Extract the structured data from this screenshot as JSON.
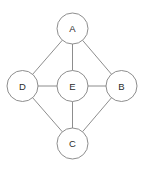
{
  "diagram": {
    "type": "undirected-graph",
    "title": "",
    "width": 145,
    "height": 169,
    "background_color": "#ffffff",
    "stroke_color": "#808080",
    "label_color": "#2b2b2b",
    "node_fill": "#ffffff",
    "node_radius": 15.5,
    "nodes": [
      {
        "id": "A",
        "label": "A",
        "cx": 72.5,
        "cy": 28.5
      },
      {
        "id": "B",
        "label": "B",
        "cx": 121.5,
        "cy": 86.0
      },
      {
        "id": "C",
        "label": "C",
        "cx": 72.5,
        "cy": 143.5
      },
      {
        "id": "D",
        "label": "D",
        "cx": 22.5,
        "cy": 86.0
      },
      {
        "id": "E",
        "label": "E",
        "cx": 72.5,
        "cy": 86.0
      }
    ],
    "edges": [
      {
        "from": "A",
        "to": "D"
      },
      {
        "from": "A",
        "to": "E"
      },
      {
        "from": "A",
        "to": "B"
      },
      {
        "from": "D",
        "to": "E"
      },
      {
        "from": "E",
        "to": "B"
      },
      {
        "from": "D",
        "to": "C"
      },
      {
        "from": "E",
        "to": "C"
      },
      {
        "from": "C",
        "to": "B"
      }
    ]
  }
}
